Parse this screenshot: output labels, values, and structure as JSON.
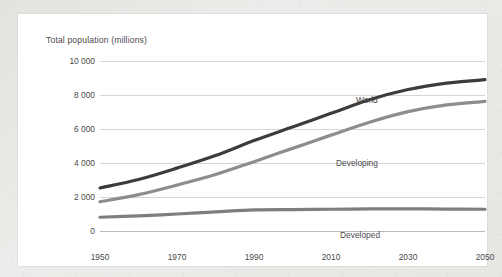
{
  "figure": {
    "panel_background": "#ffffff",
    "page_background": "#e8e8e6"
  },
  "chart_data": {
    "type": "line",
    "title": "Total population (millions)",
    "xlabel": "",
    "ylabel": "Total population (millions)",
    "xlim": [
      1950,
      2050
    ],
    "ylim": [
      0,
      10000
    ],
    "grid": true,
    "legend_position": "inline-labels",
    "x_ticks": [
      "1950",
      "1970",
      "1990",
      "2010",
      "2030",
      "2050"
    ],
    "x_tick_values": [
      1950,
      1970,
      1990,
      2010,
      2030,
      2050
    ],
    "y_ticks": [
      "0",
      "2 000",
      "4 000",
      "6 000",
      "8 000",
      "10 000"
    ],
    "y_tick_values": [
      0,
      2000,
      4000,
      6000,
      8000,
      10000
    ],
    "x": [
      1950,
      1960,
      1970,
      1980,
      1990,
      2000,
      2010,
      2020,
      2030,
      2040,
      2050
    ],
    "series": [
      {
        "name": "World",
        "color": "#3c3c3c",
        "label": "World",
        "values": [
          2530,
          3030,
          3700,
          4440,
          5320,
          6120,
          6920,
          7720,
          8320,
          8700,
          8900
        ]
      },
      {
        "name": "Developing",
        "color": "#8d8d8d",
        "label": "Developing",
        "values": [
          1720,
          2140,
          2700,
          3320,
          4080,
          4860,
          5640,
          6400,
          7020,
          7420,
          7620
        ]
      },
      {
        "name": "Developed",
        "color": "#7e7e7e",
        "label": "Developed",
        "values": [
          810,
          890,
          1000,
          1120,
          1240,
          1260,
          1280,
          1300,
          1300,
          1290,
          1280
        ]
      }
    ]
  }
}
